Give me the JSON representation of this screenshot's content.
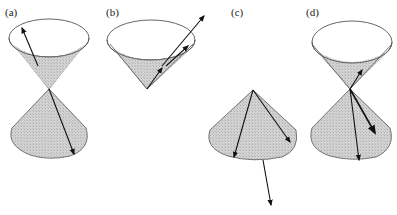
{
  "figure": {
    "panels": [
      {
        "id": "a",
        "label": "(a)",
        "description": "Double light cone (past and future) with one vector in the future cone pointing to the rim and one vector in the past cone pointing down-right"
      },
      {
        "id": "b",
        "label": "(b)",
        "description": "Future light cone with a long null-like arrow extending beyond the cone and a shorter timelike arrow inside"
      },
      {
        "id": "c",
        "label": "(c)",
        "description": "Past light cone with two arrows inside and one long arrow pointing outside the cone"
      },
      {
        "id": "d",
        "label": "(d)",
        "description": "Double light cone with one short arrow in the future cone and two arrows in the past cone"
      }
    ],
    "colors": {
      "cone_fill": "#c8c8c8",
      "outline": "#555555",
      "arrow": "#111111",
      "background": "#ffffff"
    }
  }
}
